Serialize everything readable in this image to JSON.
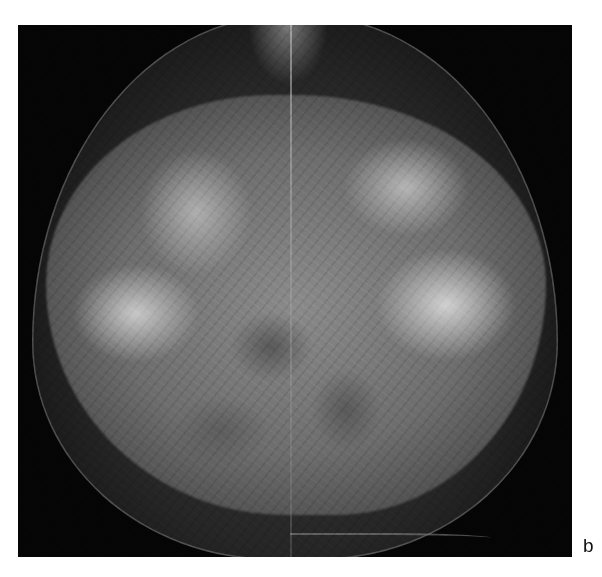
{
  "figure": {
    "panel_label": "b",
    "colors": {
      "background": "#ffffff",
      "image_background": "#050505",
      "tissue_bright": "#d8d8d8",
      "tissue_mid": "#6d6d6d"
    }
  }
}
